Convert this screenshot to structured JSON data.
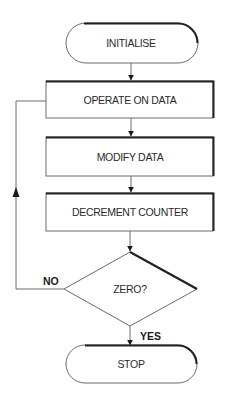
{
  "diagram": {
    "type": "flowchart",
    "colors": {
      "background": "#ffffff",
      "stroke": "#6a6a6a",
      "shadow": "#222222",
      "text": "#2a2a2a"
    },
    "nodes": [
      {
        "id": "initialise",
        "shape": "terminator",
        "label": "INITIALISE"
      },
      {
        "id": "operate",
        "shape": "process",
        "label": "OPERATE ON DATA"
      },
      {
        "id": "modify",
        "shape": "process",
        "label": "MODIFY DATA"
      },
      {
        "id": "decrement",
        "shape": "process",
        "label": "DECREMENT COUNTER"
      },
      {
        "id": "zero",
        "shape": "decision",
        "label": "ZERO?"
      },
      {
        "id": "stop",
        "shape": "terminator",
        "label": "STOP"
      }
    ],
    "edges": [
      {
        "from": "initialise",
        "to": "operate",
        "label": ""
      },
      {
        "from": "operate",
        "to": "modify",
        "label": ""
      },
      {
        "from": "modify",
        "to": "decrement",
        "label": ""
      },
      {
        "from": "decrement",
        "to": "zero",
        "label": ""
      },
      {
        "from": "zero",
        "to": "stop",
        "label": "YES"
      },
      {
        "from": "zero",
        "to": "operate",
        "label": "NO"
      }
    ]
  }
}
